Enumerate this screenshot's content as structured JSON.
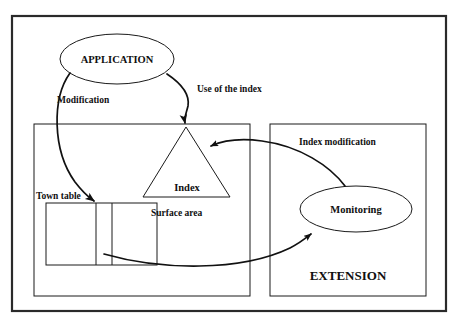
{
  "figure": {
    "type": "block-diagram",
    "title_visible": false,
    "background_color": "#ffffff",
    "line_color": "#111111",
    "text_color": "#101010"
  },
  "nodes": {
    "application_ellipse": {
      "label": "APPLICATION",
      "shape": "ellipse",
      "cx": 117,
      "cy": 59,
      "rx": 57,
      "ry": 25
    },
    "index_triangle": {
      "label": "Index",
      "shape": "triangle",
      "apex_x": 186,
      "apex_y": 127,
      "base_left_x": 143,
      "base_right_x": 230,
      "base_y": 197
    },
    "monitoring_ellipse": {
      "label": "Monitoring",
      "shape": "ellipse",
      "cx": 356,
      "cy": 209,
      "rx": 56,
      "ry": 23
    },
    "town_table": {
      "label": "Town table",
      "shape": "table",
      "x": 46,
      "y": 203,
      "width": 111,
      "height": 62,
      "columns": 3,
      "divider_x": [
        96,
        112
      ]
    },
    "surface_area": {
      "label": "Surface area"
    },
    "extension": {
      "label": "EXTENSION"
    }
  },
  "containers": {
    "outer_frame": {
      "x": 12,
      "y": 16,
      "width": 434,
      "height": 295
    },
    "left_box": {
      "x": 34,
      "y": 124,
      "width": 216,
      "height": 172
    },
    "right_box": {
      "x": 270,
      "y": 124,
      "width": 156,
      "height": 172
    }
  },
  "edges": [
    {
      "name": "modification",
      "label": "Modification",
      "from": "application_ellipse",
      "to": "town_table",
      "arrowhead": true
    },
    {
      "name": "use-of-the-index",
      "label": "Use of the index",
      "from": "application_ellipse",
      "to": "index_triangle",
      "arrowhead": true
    },
    {
      "name": "index-modification",
      "label": "Index modification",
      "from": "monitoring_ellipse",
      "to": "index_triangle",
      "arrowhead": true
    },
    {
      "name": "table-to-monitoring",
      "label": "",
      "from": "town_table",
      "to": "monitoring_ellipse",
      "arrowhead": true
    }
  ],
  "labels": {
    "application": "APPLICATION",
    "modification": "Modification",
    "use_of_the_index": "Use of the index",
    "index": "Index",
    "town_table": "Town table",
    "surface_area": "Surface area",
    "index_modification": "Index modification",
    "monitoring": "Monitoring",
    "extension": "EXTENSION"
  }
}
